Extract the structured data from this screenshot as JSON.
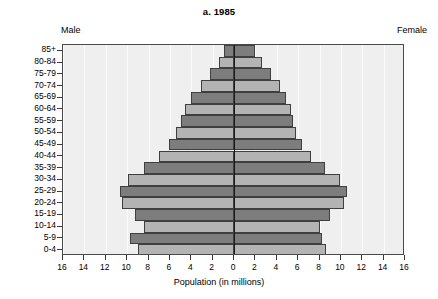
{
  "chart_data": {
    "type": "bar",
    "subtype": "population-pyramid",
    "title": "a. 1985",
    "xlabel": "Population (in millions)",
    "ylabel": "",
    "left_label": "Male",
    "right_label": "Female",
    "xlim": [
      -16,
      16
    ],
    "xticks": [
      16,
      14,
      12,
      10,
      8,
      6,
      4,
      2,
      0,
      2,
      4,
      6,
      8,
      10,
      12,
      14,
      16
    ],
    "grid": "vertical",
    "legend": "none",
    "categories": [
      "85+",
      "80-84",
      "75-79",
      "70-74",
      "65-69",
      "60-64",
      "55-59",
      "50-54",
      "45-49",
      "40-44",
      "35-39",
      "30-34",
      "25-29",
      "20-24",
      "15-19",
      "10-14",
      "5-9",
      "0-4"
    ],
    "series": [
      {
        "name": "Male",
        "side": "left",
        "values": [
          0.9,
          1.4,
          2.2,
          3.1,
          4.0,
          4.6,
          5.0,
          5.4,
          6.1,
          7.0,
          8.4,
          9.9,
          10.7,
          10.5,
          9.3,
          8.4,
          9.7,
          9.0
        ]
      },
      {
        "name": "Female",
        "side": "right",
        "values": [
          2.0,
          2.6,
          3.5,
          4.3,
          4.9,
          5.3,
          5.5,
          5.8,
          6.4,
          7.2,
          8.5,
          9.9,
          10.6,
          10.3,
          9.0,
          8.0,
          8.2,
          8.6
        ]
      }
    ],
    "bar_colors": {
      "dark": "#7d7d7d",
      "light": "#b3b3b3",
      "outline": "#3f3f3f",
      "plot_background": "#efefef",
      "axis": "#1a1a1a"
    }
  }
}
